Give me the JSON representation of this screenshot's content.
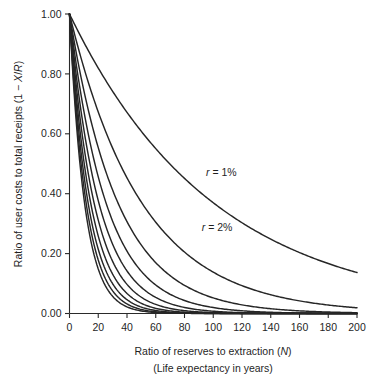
{
  "chart_data": {
    "type": "line",
    "title": "",
    "xlabel": "Ratio of reserves to extraction (N)",
    "xlabel_sub": "(Life expectancy in years)",
    "ylabel": "Ratio of user costs to total receipts (1 − X/R)",
    "xlim": [
      0,
      200
    ],
    "ylim": [
      0,
      1
    ],
    "grid": false,
    "legend": "none",
    "xticks": [
      0,
      20,
      40,
      60,
      80,
      100,
      120,
      140,
      160,
      180,
      200
    ],
    "xticklabels": [
      "0",
      "20",
      "40",
      "60",
      "80",
      "100",
      "120",
      "140",
      "160",
      "180",
      "200"
    ],
    "yticks": [
      0.0,
      0.2,
      0.4,
      0.6,
      0.8,
      1.0
    ],
    "yticklabels": [
      "0.00",
      "0.20",
      "0.40",
      "0.60",
      "0.80",
      "1.00"
    ],
    "x": [
      0,
      5,
      10,
      15,
      20,
      25,
      30,
      40,
      50,
      60,
      70,
      80,
      90,
      100,
      110,
      120,
      130,
      140,
      150,
      160,
      170,
      180,
      190,
      200
    ],
    "series": [
      {
        "name": "r = 1%",
        "rate_percent": 1,
        "label": "r = 1%",
        "label_x": 95,
        "label_y": 0.46,
        "values": [
          1.0,
          0.95,
          0.91,
          0.86,
          0.82,
          0.78,
          0.74,
          0.67,
          0.61,
          0.55,
          0.5,
          0.45,
          0.41,
          0.37,
          0.34,
          0.3,
          0.27,
          0.25,
          0.22,
          0.2,
          0.18,
          0.17,
          0.15,
          0.13
        ]
      },
      {
        "name": "r = 2%",
        "rate_percent": 2,
        "label": "r = 2%",
        "label_x": 92,
        "label_y": 0.275,
        "values": [
          1.0,
          0.91,
          0.82,
          0.74,
          0.67,
          0.61,
          0.55,
          0.45,
          0.37,
          0.3,
          0.25,
          0.2,
          0.17,
          0.14,
          0.11,
          0.09,
          0.08,
          0.06,
          0.05,
          0.04,
          0.04,
          0.03,
          0.02,
          0.02
        ]
      },
      {
        "name": "r = 3%",
        "rate_percent": 3,
        "label": "",
        "values": [
          1.0,
          0.86,
          0.74,
          0.64,
          0.55,
          0.48,
          0.41,
          0.31,
          0.23,
          0.17,
          0.13,
          0.09,
          0.07,
          0.05,
          0.04,
          0.03,
          0.02,
          0.02,
          0.01,
          0.01,
          0.01,
          0.0,
          0.0,
          0.0
        ]
      },
      {
        "name": "r = 4%",
        "rate_percent": 4,
        "label": "",
        "values": [
          1.0,
          0.82,
          0.68,
          0.56,
          0.46,
          0.38,
          0.31,
          0.21,
          0.14,
          0.1,
          0.06,
          0.04,
          0.03,
          0.02,
          0.01,
          0.01,
          0.01,
          0.0,
          0.0,
          0.0,
          0.0,
          0.0,
          0.0,
          0.0
        ]
      },
      {
        "name": "r = 5%",
        "rate_percent": 5,
        "label": "",
        "values": [
          1.0,
          0.78,
          0.61,
          0.48,
          0.38,
          0.3,
          0.23,
          0.14,
          0.09,
          0.05,
          0.03,
          0.02,
          0.01,
          0.01,
          0.0,
          0.0,
          0.0,
          0.0,
          0.0,
          0.0,
          0.0,
          0.0,
          0.0,
          0.0
        ]
      },
      {
        "name": "r = 6%",
        "rate_percent": 6,
        "label": "",
        "values": [
          1.0,
          0.75,
          0.56,
          0.42,
          0.31,
          0.23,
          0.17,
          0.1,
          0.05,
          0.03,
          0.02,
          0.01,
          0.01,
          0.0,
          0.0,
          0.0,
          0.0,
          0.0,
          0.0,
          0.0,
          0.0,
          0.0,
          0.0,
          0.0
        ]
      },
      {
        "name": "r = 7%",
        "rate_percent": 7,
        "label": "",
        "values": [
          1.0,
          0.71,
          0.51,
          0.36,
          0.26,
          0.18,
          0.13,
          0.07,
          0.03,
          0.02,
          0.01,
          0.0,
          0.0,
          0.0,
          0.0,
          0.0,
          0.0,
          0.0,
          0.0,
          0.0,
          0.0,
          0.0,
          0.0,
          0.0
        ]
      },
      {
        "name": "r = 8%",
        "rate_percent": 8,
        "label": "",
        "values": [
          1.0,
          0.68,
          0.46,
          0.32,
          0.21,
          0.15,
          0.1,
          0.05,
          0.02,
          0.01,
          0.0,
          0.0,
          0.0,
          0.0,
          0.0,
          0.0,
          0.0,
          0.0,
          0.0,
          0.0,
          0.0,
          0.0,
          0.0,
          0.0
        ]
      },
      {
        "name": "r = 9%",
        "rate_percent": 9,
        "label": "",
        "values": [
          1.0,
          0.65,
          0.42,
          0.27,
          0.18,
          0.12,
          0.08,
          0.03,
          0.01,
          0.01,
          0.0,
          0.0,
          0.0,
          0.0,
          0.0,
          0.0,
          0.0,
          0.0,
          0.0,
          0.0,
          0.0,
          0.0,
          0.0,
          0.0
        ]
      },
      {
        "name": "r = 10%",
        "rate_percent": 10,
        "label": "",
        "values": [
          1.0,
          0.62,
          0.39,
          0.24,
          0.15,
          0.09,
          0.06,
          0.02,
          0.01,
          0.0,
          0.0,
          0.0,
          0.0,
          0.0,
          0.0,
          0.0,
          0.0,
          0.0,
          0.0,
          0.0,
          0.0,
          0.0,
          0.0,
          0.0
        ]
      }
    ],
    "colors": {
      "line": "#262626",
      "axis": "#2a2a2a",
      "text": "#1f1f1f",
      "background": "#ffffff"
    }
  }
}
